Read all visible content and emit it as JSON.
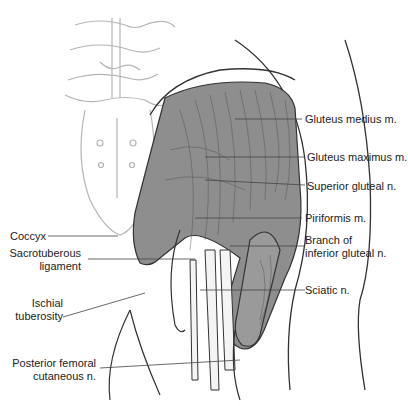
{
  "figure": {
    "colors": {
      "muscle_fill": "#8a8a8a",
      "muscle_stroke": "#333333",
      "bone_stroke": "#b0b0b0",
      "nerve_fill": "#f4f4f4",
      "leader_line": "#444444"
    },
    "labels_right": [
      {
        "id": "gluteus-medius",
        "text": "Gluteus medius m."
      },
      {
        "id": "gluteus-maximus",
        "text": "Gluteus maximus m."
      },
      {
        "id": "superior-gluteal",
        "text": "Superior gluteal n."
      },
      {
        "id": "piriformis",
        "text": "Piriformis m."
      },
      {
        "id": "branch-inferior-gluteal",
        "line1": "Branch of",
        "line2": "inferior gluteal n."
      },
      {
        "id": "sciatic",
        "text": "Sciatic n."
      }
    ],
    "labels_left": [
      {
        "id": "coccyx",
        "text": "Coccyx"
      },
      {
        "id": "sacrotuberous",
        "line1": "Sacrotuberous",
        "line2": "ligament"
      },
      {
        "id": "ischial",
        "line1": "Ischial",
        "line2": "tuberosity"
      },
      {
        "id": "posterior-femoral",
        "line1": "Posterior femoral",
        "line2": "cutaneous n."
      }
    ]
  }
}
